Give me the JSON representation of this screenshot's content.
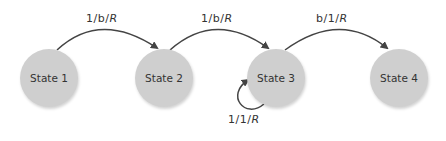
{
  "states": [
    {
      "id": "s1",
      "label": "State 1"
    },
    {
      "id": "s2",
      "label": "State 2"
    },
    {
      "id": "s3",
      "label": "State 3"
    },
    {
      "id": "s4",
      "label": "State 4"
    }
  ],
  "transitions": [
    {
      "from": "State 1",
      "to": "State 2",
      "label": "1/b/R",
      "parts": [
        "1/b/",
        "R"
      ]
    },
    {
      "from": "State 2",
      "to": "State 3",
      "label": "1/b/R",
      "parts": [
        "1/b/",
        "R"
      ]
    },
    {
      "from": "State 3",
      "to": "State 4",
      "label": "b/1/R",
      "parts": [
        "b/1/",
        "R"
      ]
    },
    {
      "from": "State 3",
      "to": "State 3",
      "label": "1/1/R",
      "parts": [
        "1/1/",
        "R"
      ]
    }
  ],
  "colors": {
    "state_fill": "#cfcfcf",
    "edge": "#444444",
    "text": "#333333"
  }
}
